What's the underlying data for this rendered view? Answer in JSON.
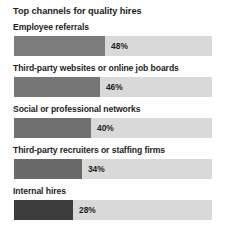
{
  "chart_data": {
    "type": "bar",
    "orientation": "horizontal",
    "title": "Top channels for quality hires",
    "xlabel": "",
    "ylabel": "",
    "grid": false,
    "legend": false,
    "value_suffix": "%",
    "axis_max_percent": 104,
    "track_color": "#d9d9d9",
    "background_color": "#ffffff",
    "text_color": "#1d1d1b",
    "categories": [
      "Employee referrals",
      "Third-party websites or online job boards",
      "Social or professional networks",
      "Third-party recruiters or staffing firms",
      "Internal hires"
    ],
    "values": [
      48,
      46,
      40,
      34,
      28
    ],
    "value_labels": [
      "48%",
      "46%",
      "40%",
      "34%",
      "28%"
    ],
    "bar_colors": [
      "#7c7c7c",
      "#767676",
      "#707070",
      "#6a6a6a",
      "#3d3d3d"
    ],
    "bars": [
      {
        "label": "Employee referrals",
        "value": 48,
        "value_label": "48%",
        "color": "#7c7c7c",
        "fill_percent": 46.0
      },
      {
        "label": "Third-party websites or online job boards",
        "value": 46,
        "value_label": "46%",
        "color": "#767676",
        "fill_percent": 43.4
      },
      {
        "label": "Social or professional networks",
        "value": 40,
        "value_label": "40%",
        "color": "#707070",
        "fill_percent": 38.9
      },
      {
        "label": "Third-party recruiters or staffing firms",
        "value": 34,
        "value_label": "34%",
        "color": "#6a6a6a",
        "fill_percent": 34.3
      },
      {
        "label": "Internal hires",
        "value": 28,
        "value_label": "28%",
        "color": "#3d3d3d",
        "fill_percent": 29.8
      }
    ]
  }
}
